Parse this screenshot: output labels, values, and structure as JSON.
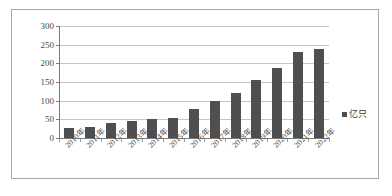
{
  "chart_data": {
    "type": "bar",
    "title": "",
    "subtitle": "",
    "xlabel": "",
    "ylabel": "",
    "categories": [
      "2010年",
      "2011年",
      "2012年",
      "2013年",
      "2014年",
      "2015年",
      "2016年",
      "2017年",
      "2018年",
      "2019年",
      "2020年",
      "2021年",
      "2022年"
    ],
    "values": [
      27,
      29,
      41,
      46,
      52,
      54,
      78,
      99,
      120,
      156,
      187,
      230,
      238
    ],
    "series": [
      {
        "name": "亿只",
        "values": [
          27,
          29,
          41,
          46,
          52,
          54,
          78,
          99,
          120,
          156,
          187,
          230,
          238
        ]
      }
    ],
    "ylim": [
      0,
      300
    ],
    "ytick_labels": [
      "300",
      "250",
      "200",
      "150",
      "100",
      "50",
      "0"
    ],
    "ytick_values": [
      300,
      250,
      200,
      150,
      100,
      50,
      0
    ],
    "grid": true,
    "legend_position": "right",
    "legend": [
      "亿只"
    ],
    "bar_color": "#4f4f4f",
    "gridline_color": "#c6c6c6",
    "axis_color": "#7a7a7a",
    "background_color": "#ffffff",
    "border_color": "#a8a8a8"
  },
  "legend": {
    "label": "亿只",
    "swatch_color": "#4f4f4f"
  }
}
